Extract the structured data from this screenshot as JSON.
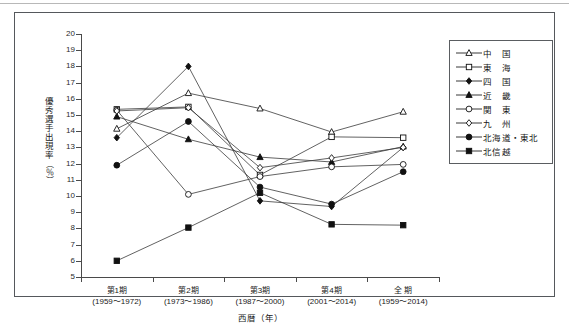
{
  "chart_data": {
    "type": "line",
    "title": "",
    "xlabel": "西暦（年）",
    "ylabel": "優秀選手出現率（%）",
    "ylabel_main": "優秀選手出現率",
    "ylabel_unit": "（％）",
    "ylim": [
      5,
      20
    ],
    "ytick_step": 1,
    "yticks": [
      "20",
      "19",
      "18",
      "17",
      "16",
      "15",
      "14",
      "13",
      "12",
      "11",
      "10",
      "9",
      "8",
      "7",
      "6",
      "5"
    ],
    "grid": false,
    "legend_position": "right",
    "categories": [
      {
        "line1": "第1期",
        "line2": "(1959～1972)"
      },
      {
        "line1": "第2期",
        "line2": "(1973～1986)"
      },
      {
        "line1": "第3期",
        "line2": "(1987～2000)"
      },
      {
        "line1": "第4期",
        "line2": "(2001～2014)"
      },
      {
        "line1": "全 期",
        "line2": "(1959～2014)"
      }
    ],
    "series": [
      {
        "name": "中　国",
        "marker": "triangle-open",
        "values": [
          14.15,
          16.35,
          15.4,
          13.95,
          15.2
        ]
      },
      {
        "name": "東　海",
        "marker": "square-open",
        "values": [
          15.35,
          15.5,
          11.3,
          13.65,
          13.6
        ]
      },
      {
        "name": "四　国",
        "marker": "diamond-filled",
        "values": [
          13.6,
          18.0,
          9.7,
          9.35,
          13.0
        ]
      },
      {
        "name": "近　畿",
        "marker": "triangle-filled",
        "values": [
          14.9,
          13.5,
          12.4,
          12.1,
          13.05
        ]
      },
      {
        "name": "関　東",
        "marker": "circle-open",
        "values": [
          15.3,
          10.1,
          11.2,
          11.8,
          11.95
        ]
      },
      {
        "name": "九　州",
        "marker": "diamond-open",
        "values": [
          15.25,
          15.45,
          11.75,
          12.35,
          13.0
        ]
      },
      {
        "name": "北海道・東北",
        "marker": "circle-filled",
        "values": [
          11.9,
          14.6,
          10.55,
          9.5,
          11.5
        ]
      },
      {
        "name": "北信越",
        "marker": "square-filled",
        "values": [
          6.0,
          8.05,
          10.2,
          8.25,
          8.2
        ]
      }
    ]
  }
}
